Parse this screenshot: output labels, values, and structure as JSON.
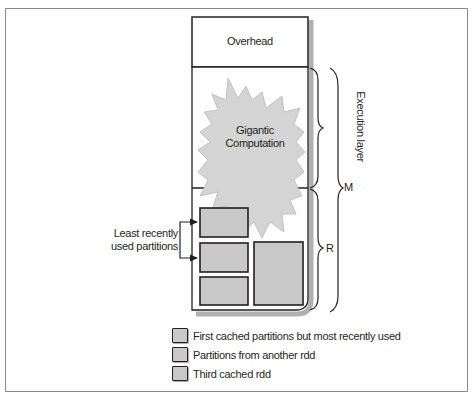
{
  "diagram": {
    "memory_box": {
      "overhead_label": "Overhead",
      "computation_label_line1": "Gigantic",
      "computation_label_line2": "Computation"
    },
    "annotations": {
      "lru_line1": "Least recently",
      "lru_line2": "used partitions",
      "execution_layer": "Execution layer",
      "m_label": "M",
      "r_label": "R"
    },
    "legend": [
      {
        "label": "First cached partitions but most recently used"
      },
      {
        "label": "Partitions from another rdd"
      },
      {
        "label": "Third cached rdd"
      }
    ],
    "colors": {
      "stroke": "#231f20",
      "partition_fill": "#c9c9c9",
      "starburst_fill": "#d4d4d4",
      "frame": "#8a8a8a",
      "shadow": "#9a9a9a"
    }
  }
}
